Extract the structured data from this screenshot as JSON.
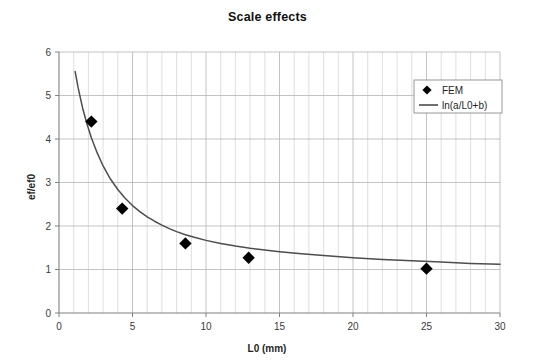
{
  "chart_data": {
    "type": "scatter",
    "title": "Scale effects",
    "xlabel": "L0 (mm)",
    "ylabel": "ef/ef0",
    "xlim": [
      0,
      30
    ],
    "ylim": [
      0,
      6
    ],
    "xticks": [
      0,
      5,
      10,
      15,
      20,
      25,
      30
    ],
    "yticks": [
      0,
      1,
      2,
      3,
      4,
      5,
      6
    ],
    "xtick_labels": [
      "0",
      "5",
      "10",
      "15",
      "20",
      "25",
      "30"
    ],
    "ytick_labels": [
      "0",
      "1",
      "2",
      "3",
      "4",
      "5",
      "6"
    ],
    "x_minor_step": 1,
    "grid": true,
    "grid_color": "#c8c8c8",
    "axis_color": "#808080",
    "legend_position": "top-right",
    "series": [
      {
        "name": "FEM",
        "type": "scatter",
        "marker": "diamond",
        "color": "#000000",
        "points": [
          {
            "x": 2.2,
            "y": 4.4
          },
          {
            "x": 4.3,
            "y": 2.4
          },
          {
            "x": 8.6,
            "y": 1.6
          },
          {
            "x": 12.9,
            "y": 1.27
          },
          {
            "x": 25.0,
            "y": 1.02
          }
        ]
      },
      {
        "name": "ln(a/L0+b)",
        "type": "line",
        "color": "#4d4d4d",
        "points": [
          {
            "x": 1.1,
            "y": 5.55
          },
          {
            "x": 1.3,
            "y": 5.18
          },
          {
            "x": 1.6,
            "y": 4.72
          },
          {
            "x": 1.9,
            "y": 4.35
          },
          {
            "x": 2.2,
            "y": 4.03
          },
          {
            "x": 2.6,
            "y": 3.68
          },
          {
            "x": 3.0,
            "y": 3.38
          },
          {
            "x": 3.5,
            "y": 3.08
          },
          {
            "x": 4.0,
            "y": 2.84
          },
          {
            "x": 4.5,
            "y": 2.64
          },
          {
            "x": 5.0,
            "y": 2.47
          },
          {
            "x": 5.5,
            "y": 2.33
          },
          {
            "x": 6.0,
            "y": 2.21
          },
          {
            "x": 6.5,
            "y": 2.11
          },
          {
            "x": 7.0,
            "y": 2.02
          },
          {
            "x": 7.5,
            "y": 1.94
          },
          {
            "x": 8.0,
            "y": 1.87
          },
          {
            "x": 8.6,
            "y": 1.8
          },
          {
            "x": 9.2,
            "y": 1.74
          },
          {
            "x": 10.0,
            "y": 1.67
          },
          {
            "x": 11.0,
            "y": 1.6
          },
          {
            "x": 12.0,
            "y": 1.54
          },
          {
            "x": 13.0,
            "y": 1.49
          },
          {
            "x": 14.0,
            "y": 1.45
          },
          {
            "x": 15.0,
            "y": 1.41
          },
          {
            "x": 16.5,
            "y": 1.36
          },
          {
            "x": 18.0,
            "y": 1.32
          },
          {
            "x": 20.0,
            "y": 1.27
          },
          {
            "x": 22.0,
            "y": 1.23
          },
          {
            "x": 24.0,
            "y": 1.2
          },
          {
            "x": 26.0,
            "y": 1.17
          },
          {
            "x": 28.0,
            "y": 1.14
          },
          {
            "x": 30.0,
            "y": 1.12
          }
        ]
      }
    ],
    "legend": [
      {
        "label": "FEM",
        "marker": "diamond",
        "color": "#000000"
      },
      {
        "label": "ln(a/L0+b)",
        "marker": "line",
        "color": "#4d4d4d"
      }
    ]
  }
}
